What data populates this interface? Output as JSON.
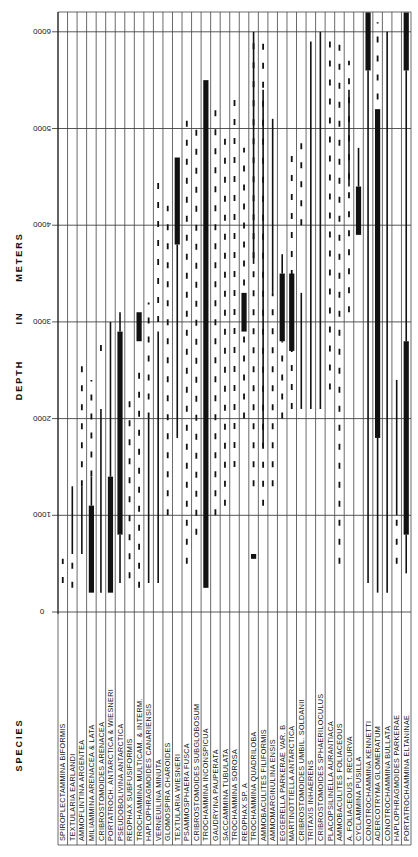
{
  "chart_data": {
    "type": "bar",
    "subtype": "range-chart",
    "orientation": "rotated-90",
    "title": "",
    "xlabel": "SPECIES",
    "ylabel": "DEPTH IN METERS",
    "ylim": [
      0,
      6000
    ],
    "yticks": [
      0,
      1000,
      2000,
      3000,
      4000,
      5000,
      6000
    ],
    "grid": true,
    "legend": "none",
    "categories": [
      "SPIROPLECTAMMINA BIFORMIS",
      "TEXTULARIA EARLANDI",
      "AMMOFLINTINA ARGENTEA",
      "MILIAMMINA ARENACEA & LATA",
      "CRIBROSTOMOIDES ARENACEA",
      "PORTATROCH. ANTARCTICA & WIESNERI",
      "PSEUDOBOLIVINA ANTARCTICA",
      "REOPHAX SUBFUSIFORMIS",
      "TROCHAMMINA MULTICAM. & INTERM.",
      "HAPLOPHRAGMOIDES CANARIENSIS",
      "VERNEUILINA MINUTA",
      "GLOMOSPIRA CHAROIDES",
      "TEXTULARIA WIESNERI",
      "PSAMMOSPHAERA FUSCA",
      "CRIBROSTOMOIDES SUBGLOBOSUM",
      "TROCHAMMINA INCONSPICUA",
      "GAUDRYINA PAUPERATA",
      "SACCAMMINA TUBULATA",
      "TROCHAMMINA SOROSA",
      "REOPHAX SP. A",
      "TROCHAMMINA QUADRILOBA",
      "AMMOBACULITES FILIFORMIS",
      "AMMOMARGINULINA ENSIS",
      "EGGERELLA PARKERAE VAR. B",
      "MARTINOTTIELLA ANTARCTICA",
      "CRIBROSTOMOIDES UMBIL. SOLDANII",
      "TRITAXIS INHAERENS",
      "CRIBROSTOMOIDES SPHAERILOCULUS",
      "PLACOPSILINELLA AURANTIACA",
      "AMMOBACULITES FOLIACEOUS",
      "A. FOLIACEOUS f. RECURVA",
      "CYCLAMMINA PUSILLA",
      "CONOTROCHAMMINA KENNETTI",
      "ADERCOTRYMA GLOMERATUM",
      "CONOTROCHAMMINA BULLATA",
      "HAPLOPHRAGMOIDES PARKERAE",
      "PORTATROCHAMMINA ELTANINAE"
    ],
    "series": [
      {
        "species": "SPIROPLECTAMMINA BIFORMIS",
        "thick": [],
        "thin": [],
        "dashed": [
          [
            300,
            550
          ]
        ]
      },
      {
        "species": "TEXTULARIA EARLANDI",
        "thick": [],
        "thin": [
          [
            600,
            1300
          ]
        ],
        "dashed": [
          [
            250,
            550
          ]
        ]
      },
      {
        "species": "AMMOFLINTINA ARGENTEA",
        "thick": [],
        "thin": [
          [
            600,
            1300
          ]
        ],
        "dashed": [
          [
            1300,
            2600
          ]
        ]
      },
      {
        "species": "MILIAMMINA ARENACEA & LATA",
        "thick": [
          [
            200,
            1100
          ]
        ],
        "thin": [
          [
            1100,
            1400
          ]
        ],
        "dashed": [
          [
            1400,
            2400
          ]
        ]
      },
      {
        "species": "CRIBROSTOMOIDES ARENACEA",
        "thick": [],
        "thin": [
          [
            200,
            2100
          ]
        ],
        "dashed": [
          [
            2700,
            2800
          ]
        ]
      },
      {
        "species": "PORTATROCH. ANTARCTICA & WIESNERI",
        "thick": [
          [
            200,
            1400
          ]
        ],
        "thin": [
          [
            1400,
            3000
          ]
        ],
        "dashed": []
      },
      {
        "species": "PSEUDOBOLIVINA ANTARCTICA",
        "thick": [
          [
            800,
            2900
          ]
        ],
        "thin": [
          [
            300,
            800
          ],
          [
            2900,
            3100
          ]
        ],
        "dashed": []
      },
      {
        "species": "REOPHAX SUBFUSIFORMIS",
        "thick": [],
        "thin": [],
        "dashed": [
          [
            350,
            2300
          ]
        ]
      },
      {
        "species": "TROCHAMMINA MULTICAM. & INTERM.",
        "thick": [
          [
            2800,
            3100
          ]
        ],
        "thin": [],
        "dashed": [
          [
            250,
            2500
          ]
        ]
      },
      {
        "species": "HAPLOPHRAGMOIDES CANARIENSIS",
        "thick": [],
        "thin": [
          [
            300,
            2000
          ]
        ],
        "dashed": [
          [
            2000,
            3200
          ]
        ]
      },
      {
        "species": "VERNEUILINA MINUTA",
        "thick": [],
        "thin": [
          [
            300,
            2900
          ]
        ],
        "dashed": [
          [
            3000,
            4500
          ]
        ]
      },
      {
        "species": "GLOMOSPIRA CHAROIDES",
        "thick": [],
        "thin": [],
        "dashed": [
          [
            1000,
            4200
          ]
        ]
      },
      {
        "species": "TEXTULARIA WIESNERI",
        "thick": [
          [
            3800,
            4700
          ]
        ],
        "thin": [
          [
            1800,
            3800
          ]
        ],
        "dashed": []
      },
      {
        "species": "PSAMMOSPHAERA FUSCA",
        "thick": [],
        "thin": [],
        "dashed": [
          [
            500,
            5200
          ]
        ]
      },
      {
        "species": "CRIBROSTOMOIDES SUBGLOBOSUM",
        "thick": [],
        "thin": [],
        "dashed": [
          [
            800,
            5000
          ]
        ]
      },
      {
        "species": "TROCHAMMINA INCONSPICUA",
        "thick": [
          [
            250,
            5500
          ]
        ],
        "thin": [],
        "dashed": [
          [
            1000,
            1300
          ]
        ]
      },
      {
        "species": "GAUDRYINA PAUPERATA",
        "thick": [],
        "thin": [],
        "dashed": [
          [
            1000,
            5200
          ]
        ]
      },
      {
        "species": "SACCAMMINA TUBULATA",
        "thick": [],
        "thin": [],
        "dashed": [
          [
            1100,
            4900
          ]
        ]
      },
      {
        "species": "TROCHAMMINA SOROSA",
        "thick": [],
        "thin": [],
        "dashed": [
          [
            1500,
            5300
          ]
        ]
      },
      {
        "species": "REOPHAX SP. A",
        "thick": [
          [
            2900,
            3300
          ]
        ],
        "thin": [],
        "dashed": [
          [
            2000,
            4800
          ]
        ]
      },
      {
        "species": "TROCHAMMINA QUADRILOBA",
        "thick": [
          [
            550,
            600
          ]
        ],
        "thin": [
          [
            3600,
            6000
          ]
        ],
        "dashed": [
          [
            1300,
            6000
          ]
        ]
      },
      {
        "species": "AMMOBACULITES FILIFORMIS",
        "thick": [],
        "thin": [
          [
            1700,
            5400
          ]
        ],
        "dashed": [
          [
            1100,
            6000
          ]
        ]
      },
      {
        "species": "AMMOMARGINULINA ENSIS",
        "thick": [],
        "thin": [
          [
            3300,
            5100
          ]
        ],
        "dashed": [
          [
            1300,
            3300
          ]
        ]
      },
      {
        "species": "EGGERELLA PARKERAE VAR. B",
        "thick": [
          [
            2800,
            3500
          ]
        ],
        "thin": [
          [
            3500,
            3700
          ]
        ],
        "dashed": [
          [
            2000,
            2800
          ]
        ]
      },
      {
        "species": "MARTINOTTIELLA ANTARCTICA",
        "thick": [
          [
            2700,
            3500
          ]
        ],
        "thin": [],
        "dashed": [
          [
            2100,
            4800
          ]
        ]
      },
      {
        "species": "CRIBROSTOMOIDES UMBIL. SOLDANII",
        "thick": [],
        "thin": [
          [
            2100,
            3300
          ]
        ],
        "dashed": [
          [
            4000,
            4900
          ]
        ]
      },
      {
        "species": "TRITAXIS INHAERENS",
        "thick": [],
        "thin": [
          [
            2100,
            5900
          ]
        ],
        "dashed": []
      },
      {
        "species": "CRIBROSTOMOIDES SPHAERILOCULUS",
        "thick": [],
        "thin": [
          [
            2100,
            6000
          ]
        ],
        "dashed": []
      },
      {
        "species": "PLACOPSILINELLA AURANTIACA",
        "thick": [],
        "thin": [],
        "dashed": [
          [
            2300,
            6000
          ]
        ]
      },
      {
        "species": "AMMOBACULITES FOLIACEOUS",
        "thick": [],
        "thin": [],
        "dashed": [
          [
            500,
            5900
          ]
        ]
      },
      {
        "species": "A. FOLIACEOUS f. RECURVA",
        "thick": [],
        "thin": [
          [
            4400,
            5400
          ]
        ],
        "dashed": [
          [
            3100,
            5700
          ]
        ]
      },
      {
        "species": "CYCLAMMINA PUSILLA",
        "thick": [
          [
            3900,
            4400
          ]
        ],
        "thin": [
          [
            4400,
            4800
          ]
        ],
        "dashed": []
      },
      {
        "species": "CONOTROCHAMMINA KENNETTI",
        "thick": [
          [
            5600,
            6200
          ]
        ],
        "thin": [
          [
            300,
            5600
          ]
        ],
        "dashed": []
      },
      {
        "species": "ADERCOTRYMA GLOMERATUM",
        "thick": [
          [
            1800,
            5200
          ]
        ],
        "thin": [
          [
            200,
            1800
          ]
        ],
        "dashed": [
          [
            5300,
            6100
          ]
        ]
      },
      {
        "species": "CONOTROCHAMMINA BULLATA",
        "thick": [],
        "thin": [
          [
            200,
            6000
          ]
        ],
        "dashed": []
      },
      {
        "species": "HAPLOPHRAGMOIDES PARKERAE",
        "thick": [],
        "thin": [
          [
            1000,
            2400
          ]
        ],
        "dashed": [
          [
            500,
            1000
          ]
        ]
      },
      {
        "species": "PORTATROCHAMMINA ELTANINAE",
        "thick": [
          [
            800,
            2800
          ],
          [
            5600,
            6200
          ]
        ],
        "thin": [
          [
            400,
            800
          ],
          [
            2800,
            5600
          ]
        ],
        "dashed": []
      }
    ]
  },
  "labels": {
    "y_axis_title_1": "DEPTH",
    "y_axis_title_2": "IN",
    "y_axis_title_3": "METERS",
    "x_axis_title": "SPECIES"
  },
  "colors": {
    "ink": "#111111",
    "grid": "#444444",
    "background": "#ffffff"
  }
}
